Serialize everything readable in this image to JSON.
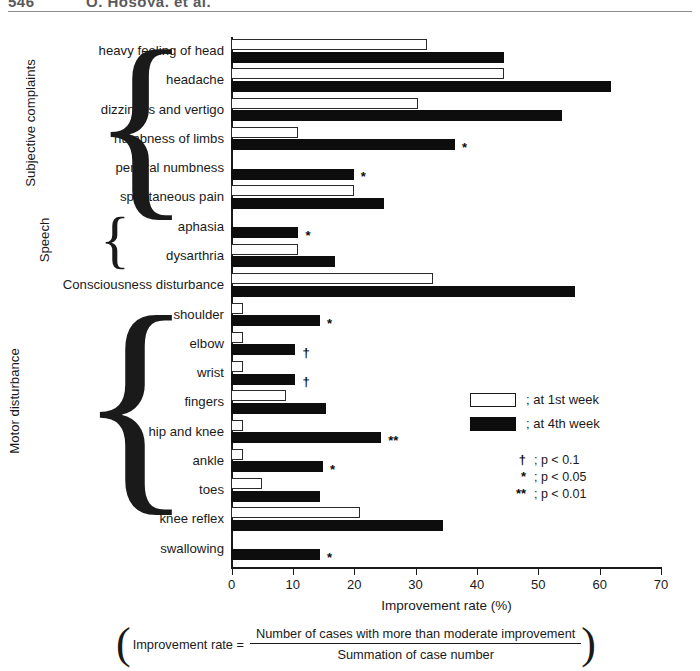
{
  "running_head": {
    "page_number": "546",
    "authors": "O. Hosoya, et al."
  },
  "chart_data": {
    "type": "bar",
    "orientation": "horizontal",
    "title": "",
    "xlabel": "Improvement rate (%)",
    "ylabel": "",
    "xlim": [
      0,
      70
    ],
    "xticks": [
      0,
      10,
      20,
      30,
      40,
      50,
      60,
      70
    ],
    "grid": false,
    "legend_position": "right-middle",
    "series": [
      {
        "name": "at 1st week",
        "style": "open",
        "color": "#ffffff"
      },
      {
        "name": "at 4th week",
        "style": "solid",
        "color": "#0d0d0d"
      }
    ],
    "categories": [
      "heavy feeling of head",
      "headache",
      "dizziness and vertigo",
      "numbness of limbs",
      "perioral numbness",
      "spontaneous pain",
      "aphasia",
      "dysarthria",
      "Consciousness disturbance",
      "shoulder",
      "elbow",
      "wrist",
      "fingers",
      "hip and knee",
      "ankle",
      "toes",
      "knee reflex",
      "swallowing"
    ],
    "values_week1": [
      32,
      44.5,
      30.5,
      11,
      0,
      20,
      0,
      11,
      33,
      2,
      2,
      2,
      9,
      2,
      2,
      5,
      21,
      0
    ],
    "values_week4": [
      44.5,
      62,
      54,
      36.5,
      20,
      25,
      11,
      17,
      56,
      14.5,
      10.5,
      10.5,
      15.5,
      24.5,
      15,
      14.5,
      34.5,
      14.5
    ],
    "significance": [
      "",
      "",
      "",
      "*",
      "*",
      "",
      "*",
      "",
      "",
      "*",
      "†",
      "†",
      "",
      "**",
      "*",
      "",
      "",
      "*"
    ],
    "groups": [
      {
        "label": "Subjective complaints",
        "from": 0,
        "to": 5
      },
      {
        "label": "Speech",
        "from": 6,
        "to": 7
      },
      {
        "label": "Motor disturbance",
        "from": 9,
        "to": 15
      }
    ]
  },
  "legend": {
    "entries": [
      {
        "marker": "open-rect",
        "text": "; at 1st week"
      },
      {
        "marker": "solid-rect",
        "text": "; at 4th week"
      }
    ],
    "significance": [
      {
        "mark": "†",
        "text": "; p < 0.1"
      },
      {
        "mark": "*",
        "text": "; p < 0.05"
      },
      {
        "mark": "**",
        "text": "; p < 0.01"
      }
    ]
  },
  "caption": {
    "lead": "Improvement rate  =",
    "numerator": "Number of cases with more than moderate improvement",
    "denominator": "Summation of case number"
  }
}
